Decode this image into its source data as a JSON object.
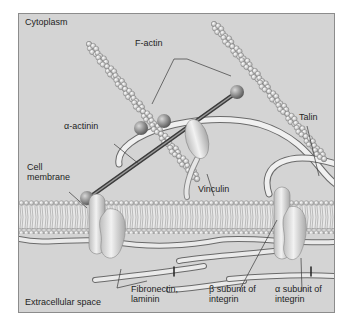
{
  "diagram": {
    "regions": {
      "top": "Cytoplasm",
      "bottom": "Extracellular space"
    },
    "labels": {
      "f_actin": "F-actin",
      "alpha_actinin": "α-actinin",
      "talin": "Talin",
      "cell_membrane_1": "Cell",
      "cell_membrane_2": "membrane",
      "vinculin": "Vinculin",
      "fibronectin_1": "Fibronectin,",
      "fibronectin_2": "laminin",
      "beta_integrin_1": "β subunit of",
      "beta_integrin_2": "integrin",
      "alpha_integrin_1": "α subunit of",
      "alpha_integrin_2": "integrin"
    },
    "colors": {
      "background": "#d4d4d4",
      "membrane_head": "#c8c8c8",
      "protein": "#dedede",
      "actin_bead": "#e6e6e6",
      "linker": "#5a5a5a",
      "leader_line": "#3a3a3a"
    }
  }
}
